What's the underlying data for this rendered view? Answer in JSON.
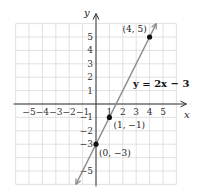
{
  "chart_data": {
    "type": "line",
    "title": "",
    "xlabel": "x",
    "ylabel": "y",
    "xlim": [
      -6,
      6
    ],
    "ylim": [
      -6,
      6
    ],
    "grid": true,
    "x_ticks": [
      "-5",
      "-4",
      "-3",
      "-2",
      "-1",
      "1",
      "2",
      "3",
      "4",
      "5"
    ],
    "y_ticks": [
      "5",
      "4",
      "3",
      "2",
      "1",
      "-1",
      "-2",
      "-3",
      "-5"
    ],
    "series": [
      {
        "name": "y = 2x - 3",
        "equation": "y = 2x − 3",
        "slope": 2,
        "intercept": -3,
        "x": [
          -1.5,
          4.5
        ],
        "y": [
          -6,
          6
        ]
      }
    ],
    "points": [
      {
        "x": 4,
        "y": 5,
        "label": "(4, 5)"
      },
      {
        "x": 1,
        "y": -1,
        "label": "(1, −1)"
      },
      {
        "x": 0,
        "y": -3,
        "label": "(0, −3)"
      }
    ],
    "annotations": [
      {
        "text": "y = 2x − 3",
        "near": [
          3.5,
          1.8
        ]
      }
    ],
    "colors": {
      "line": "#8a8a8a",
      "point": "#111111",
      "grid": "#d9d9d9",
      "axis": "#333333"
    }
  }
}
